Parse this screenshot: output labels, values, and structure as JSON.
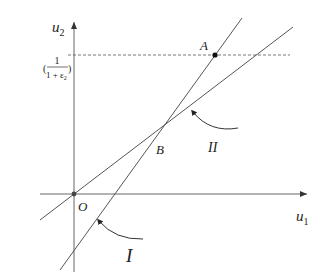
{
  "diagram": {
    "axes": {
      "x_label": "u",
      "x_sub": "1",
      "y_label": "u",
      "y_sub": "2",
      "origin_label": "O"
    },
    "y_tick": {
      "numerator": "1",
      "denominator": "1 + ε",
      "denominator_sub": "2",
      "open_paren": "(",
      "close_paren": ")"
    },
    "points": {
      "A": "A",
      "B": "B"
    },
    "lines": {
      "I": "I",
      "II": "II"
    },
    "colors": {
      "line": "#555555",
      "point": "#111111",
      "background": "#ffffff"
    }
  }
}
